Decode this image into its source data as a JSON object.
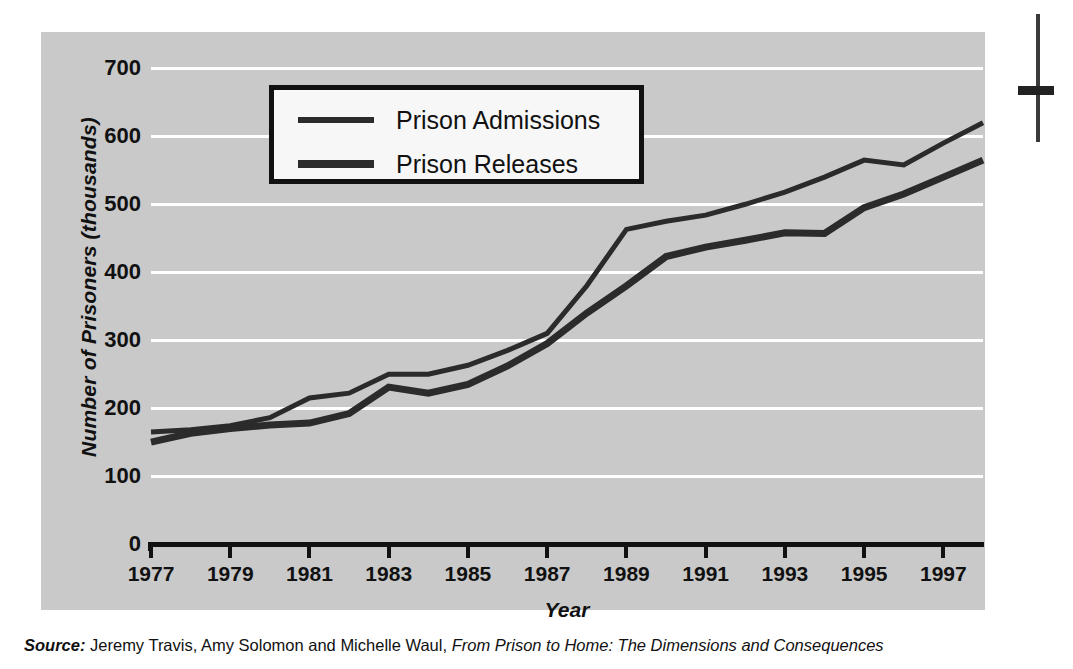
{
  "chart_data": {
    "type": "line",
    "title": "",
    "xlabel": "Year",
    "ylabel": "Number of Prisoners (thousands)",
    "xlim": [
      1977,
      1998
    ],
    "ylim": [
      0,
      730
    ],
    "grid": true,
    "grid_axis": "y",
    "legend_position": "top-left inside plot",
    "y_ticks": [
      0,
      100,
      200,
      300,
      400,
      500,
      600,
      700
    ],
    "y_tick_labels": [
      "0",
      "100",
      "200",
      "300",
      "400",
      "500",
      "600",
      "700"
    ],
    "x_ticks": [
      1977,
      1979,
      1981,
      1983,
      1985,
      1987,
      1989,
      1991,
      1993,
      1995,
      1997
    ],
    "x_tick_labels": [
      "1977",
      "1979",
      "1981",
      "1983",
      "1985",
      "1987",
      "1989",
      "1991",
      "1993",
      "1995",
      "1997"
    ],
    "x": [
      1977,
      1978,
      1979,
      1980,
      1981,
      1982,
      1983,
      1984,
      1985,
      1986,
      1987,
      1988,
      1989,
      1990,
      1991,
      1992,
      1993,
      1994,
      1995,
      1996,
      1997,
      1998
    ],
    "series": [
      {
        "name": "Prison Admissions",
        "color": "#2b2b2b",
        "line_width": 5,
        "values": [
          165,
          168,
          174,
          186,
          215,
          222,
          250,
          250,
          263,
          285,
          310,
          380,
          463,
          475,
          484,
          500,
          518,
          540,
          565,
          558,
          590,
          620
        ]
      },
      {
        "name": "Prison Releases",
        "color": "#2b2b2b",
        "line_width": 7,
        "values": [
          150,
          163,
          170,
          175,
          178,
          192,
          231,
          222,
          235,
          262,
          295,
          340,
          380,
          423,
          437,
          447,
          458,
          457,
          495,
          515,
          540,
          565
        ]
      }
    ]
  },
  "legend": {
    "items": [
      {
        "label": "Prison Admissions"
      },
      {
        "label": "Prison Releases"
      }
    ]
  },
  "source_note": {
    "prefix": "Source:",
    "authors": "Jeremy Travis, Amy Solomon and Michelle Waul,",
    "title": "From Prison to Home: The Dimensions and Consequences"
  }
}
